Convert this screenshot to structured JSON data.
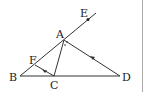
{
  "diagram": {
    "points": {
      "A": {
        "label": "A",
        "x": 65,
        "y": 40
      },
      "B": {
        "label": "B",
        "x": 20,
        "y": 76
      },
      "C": {
        "label": "C",
        "x": 54,
        "y": 76
      },
      "D": {
        "label": "D",
        "x": 120,
        "y": 76
      },
      "E": {
        "label": "E",
        "x": 88,
        "y": 19
      },
      "F": {
        "label": "F",
        "x": 35,
        "y": 65
      }
    },
    "segments": [
      "BD",
      "BE",
      "AC",
      "AD",
      "CF"
    ],
    "parallel_marks": [
      "CF",
      "DA"
    ],
    "colors": {
      "line": "#333333",
      "border": "#999999"
    }
  }
}
